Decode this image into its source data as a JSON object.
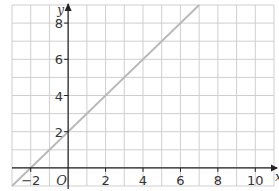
{
  "chart_data": {
    "type": "line",
    "title": "",
    "xlabel": "x",
    "ylabel": "y",
    "origin_label": "O",
    "xlim": [
      -3,
      11
    ],
    "ylim": [
      -1,
      9
    ],
    "grid": true,
    "grid_step": 1,
    "x_ticks": [
      -2,
      2,
      4,
      6,
      8,
      10
    ],
    "x_tick_labels": [
      "−2",
      "2",
      "4",
      "6",
      "8",
      "10"
    ],
    "y_ticks": [
      2,
      4,
      6,
      8
    ],
    "y_tick_labels": [
      "2",
      "4",
      "6",
      "8"
    ],
    "series": [
      {
        "name": "y = x + 2",
        "color": "#b8b8b8",
        "x": [
          -3,
          7
        ],
        "y": [
          -1,
          9
        ]
      }
    ]
  },
  "colors": {
    "grid": "#cfcfcf",
    "axis": "#222222",
    "line": "#b8b8b8"
  }
}
